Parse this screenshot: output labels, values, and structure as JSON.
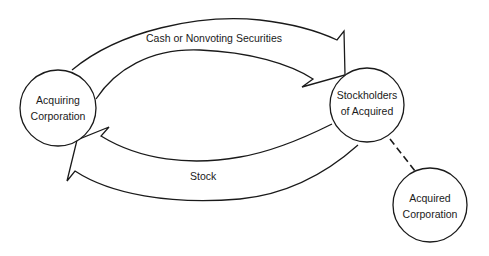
{
  "diagram": {
    "nodes": {
      "acquiring": {
        "line1": "Acquiring",
        "line2": "Corporation"
      },
      "stockholders": {
        "line1": "Stockholders",
        "line2": "of Acquired"
      },
      "acquired": {
        "line1": "Acquired",
        "line2": "Corporation"
      }
    },
    "flows": {
      "top": {
        "label": "Cash or Nonvoting Securities",
        "from": "Acquiring Corporation",
        "to": "Stockholders of Acquired"
      },
      "bottom": {
        "label": "Stock",
        "from": "Stockholders of Acquired",
        "to": "Acquiring Corporation"
      }
    },
    "link": {
      "from": "Stockholders of Acquired",
      "to": "Acquired Corporation",
      "style": "dashed"
    },
    "colors": {
      "stroke": "#1a1a1a",
      "background": "#ffffff"
    }
  }
}
